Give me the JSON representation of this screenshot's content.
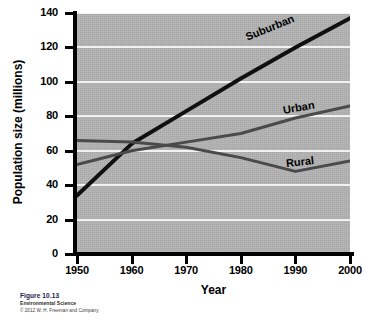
{
  "chart_data": {
    "type": "line",
    "title": "",
    "xlabel": "Year",
    "ylabel": "Population size (millions)",
    "xlim": [
      1950,
      2000
    ],
    "ylim": [
      0,
      140
    ],
    "x_ticks": [
      "1950",
      "1960",
      "1970",
      "1980",
      "1990",
      "2000"
    ],
    "y_ticks": [
      "0",
      "20",
      "40",
      "60",
      "80",
      "100",
      "120",
      "140"
    ],
    "grid": "horizontal white gridlines on gray panel",
    "legend_position": "inline labels at right end of each line",
    "x": [
      1950,
      1960,
      1970,
      1980,
      1990,
      2000
    ],
    "series": [
      {
        "name": "Suburban",
        "color": "#101010",
        "width": 4,
        "values": [
          34,
          64,
          83,
          102,
          120,
          137
        ]
      },
      {
        "name": "Urban",
        "color": "#4a4a4a",
        "width": 3,
        "values": [
          52,
          60,
          65,
          70,
          79,
          86
        ]
      },
      {
        "name": "Rural",
        "color": "#4a4a4a",
        "width": 3,
        "values": [
          66,
          65,
          62,
          56,
          48,
          54
        ]
      }
    ],
    "annotations": [
      {
        "text": "Suburban",
        "x": 1988,
        "y": 127
      },
      {
        "text": "Urban",
        "x": 1995,
        "y": 89
      },
      {
        "text": "Rural",
        "x": 1995,
        "y": 58
      }
    ]
  },
  "caption": {
    "figure_number": "Figure 10.13",
    "book_title": "Environmental Science",
    "copyright": "© 2012 W. H. Freeman and Company"
  },
  "colors": {
    "panel": "#b4b4b4",
    "gridline": "#f2f2f2",
    "axis": "#000000",
    "suburban": "#101010",
    "urban": "#4a4a4a",
    "rural": "#4a4a4a",
    "caption_accent": "#1a1a4e"
  }
}
